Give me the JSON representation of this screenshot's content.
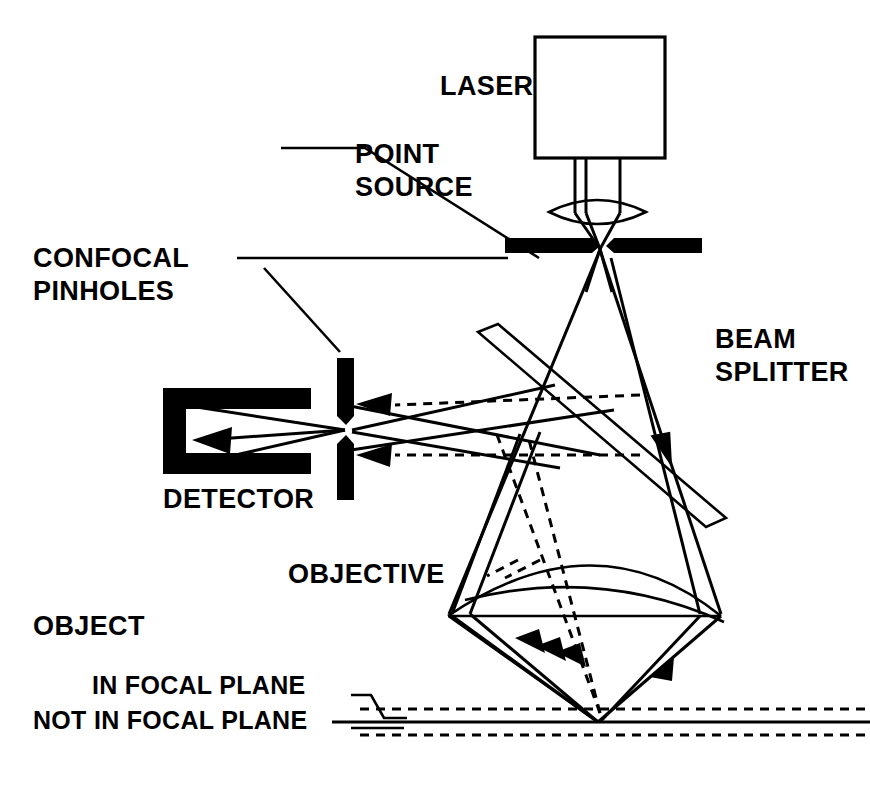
{
  "diagram": {
    "background_color": "#ffffff",
    "line_color": "#000000",
    "labels": {
      "laser": "LASER",
      "point_source_line1": "POINT",
      "point_source_line2": "SOURCE",
      "confocal_pinholes_line1": "CONFOCAL",
      "confocal_pinholes_line2": "PINHOLES",
      "beam_splitter_line1": "BEAM",
      "beam_splitter_line2": "SPLITTER",
      "detector": "DETECTOR",
      "objective": "OBJECTIVE",
      "object": "OBJECT",
      "in_focal_plane": "IN FOCAL PLANE",
      "not_in_focal_plane": "NOT IN FOCAL PLANE"
    },
    "components": [
      {
        "name": "laser-source-box",
        "type": "rectangle",
        "x": 535,
        "y": 37,
        "width": 130,
        "height": 121,
        "filled": false
      },
      {
        "name": "condenser-lens",
        "type": "lens",
        "cx": 597,
        "cy": 212,
        "rx": 48,
        "ry": 17
      },
      {
        "name": "source-pinhole-bar-left",
        "type": "filled-bar-horizontal",
        "x1": 505,
        "x2": 598,
        "y": 245,
        "thickness": 15
      },
      {
        "name": "source-pinhole-bar-right",
        "type": "filled-bar-horizontal",
        "x1": 614,
        "x2": 702,
        "y": 245,
        "thickness": 15
      },
      {
        "name": "detector-pinhole-bar-upper",
        "type": "filled-bar-vertical",
        "x": 345,
        "y1": 358,
        "y2": 422,
        "thickness": 17
      },
      {
        "name": "detector-pinhole-bar-lower",
        "type": "filled-bar-vertical",
        "x": 345,
        "y1": 440,
        "y2": 500,
        "thickness": 17
      },
      {
        "name": "detector-body",
        "type": "c-shape",
        "x": 163,
        "y": 388,
        "width": 148,
        "height": 86
      },
      {
        "name": "beam-splitter-plate",
        "type": "tilted-parallelogram",
        "angle_deg": 46
      },
      {
        "name": "objective-lens",
        "type": "plano-convex",
        "left": 448,
        "right": 721,
        "flat_y": 616,
        "apex_y": 536
      },
      {
        "name": "focal-plane-solid",
        "type": "line",
        "y": 722
      },
      {
        "name": "focal-plane-dashed-upper",
        "type": "dashed-line",
        "y": 709
      },
      {
        "name": "focal-plane-dashed-lower",
        "type": "dashed-line",
        "y": 735
      }
    ],
    "rays": {
      "illumination_style": "solid",
      "out_of_focus_style": "dashed",
      "focal_point_x": 598,
      "focal_point_y": 722,
      "arrow_count": 6
    }
  }
}
